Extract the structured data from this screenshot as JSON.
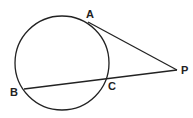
{
  "diagram": {
    "type": "geometry",
    "circle": {
      "cx": 62,
      "cy": 63,
      "r": 47
    },
    "points": {
      "A": {
        "label": "A",
        "x": 88,
        "y": 22,
        "label_x": 86,
        "label_y": 18
      },
      "B": {
        "label": "B",
        "x": 24,
        "y": 89,
        "label_x": 10,
        "label_y": 96
      },
      "C": {
        "label": "C",
        "x": 108,
        "y": 79,
        "label_x": 108,
        "label_y": 90
      },
      "P": {
        "label": "P",
        "x": 177,
        "y": 70,
        "label_x": 181,
        "label_y": 74
      }
    },
    "segments": [
      {
        "name": "tangent-PA",
        "from": "A",
        "to": "P"
      },
      {
        "name": "secant-PB",
        "from": "B",
        "to": "P"
      }
    ],
    "stroke_color": "#222222"
  }
}
